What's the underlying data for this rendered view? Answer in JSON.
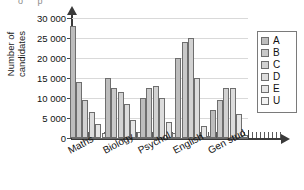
{
  "top_artifact": "o  p",
  "chart_data": {
    "type": "bar",
    "title": "",
    "xlabel": "",
    "ylabel": "Number of candidates",
    "ylabel_lines": [
      "Number of",
      "candidates"
    ],
    "ylim": [
      0,
      30000
    ],
    "ytick_values": [
      0,
      5000,
      10000,
      15000,
      20000,
      25000,
      30000
    ],
    "ytick_labels": [
      "0",
      "5 000",
      "10 000",
      "15 000",
      "20 000",
      "25 000",
      "30 000"
    ],
    "grid": true,
    "grid_axis": "y",
    "legend_position": "right",
    "categories": [
      "Maths",
      "Biology",
      "Psychol",
      "English",
      "Gen stud"
    ],
    "series": [
      {
        "name": "A",
        "color": "#bdbdbd",
        "values": [
          28000,
          15000,
          10000,
          20000,
          7000
        ]
      },
      {
        "name": "B",
        "color": "#c9c9c9",
        "values": [
          14000,
          12500,
          12500,
          24000,
          9500
        ]
      },
      {
        "name": "C",
        "color": "#d2d2d2",
        "values": [
          9500,
          11500,
          13000,
          25000,
          12500
        ]
      },
      {
        "name": "D",
        "color": "#dcdcdc",
        "values": [
          6500,
          8500,
          10000,
          15000,
          12500
        ]
      },
      {
        "name": "E",
        "color": "#e6e6e6",
        "values": [
          3500,
          4500,
          4000,
          3000,
          6000
        ]
      },
      {
        "name": "U",
        "color": "#f2f2f2",
        "values": [
          1200,
          1500,
          1200,
          500,
          700
        ]
      }
    ]
  },
  "legend": {
    "items": [
      {
        "label": "A"
      },
      {
        "label": "B"
      },
      {
        "label": "C"
      },
      {
        "label": "D"
      },
      {
        "label": "E"
      },
      {
        "label": "U"
      }
    ]
  }
}
